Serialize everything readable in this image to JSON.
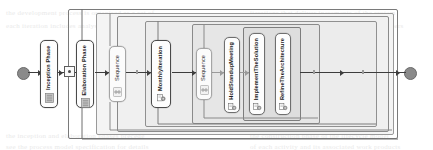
{
  "diagram": {
    "type": "uml-activity-diagram",
    "colors": {
      "node_border": "#6f6f6f",
      "node_fill": "#fdfdfd",
      "frame_fill": "#f0f0f0",
      "terminal_fill": "#8a8a8a",
      "edge": "#3d3d3d"
    }
  },
  "nodes": {
    "start": {
      "name": "initial-node",
      "label": ""
    },
    "inception_phase": {
      "label": "Inception Phase",
      "icon": "phase-icon"
    },
    "junction": {
      "label": "",
      "icon": "junction-dot"
    },
    "elaboration_phase": {
      "label": "Elaboration Phase",
      "icon": "phase-icon"
    },
    "sequence_outer": {
      "label": "Sequence",
      "icon": "sequence-icon"
    },
    "monthly_iteration": {
      "label": "MonthlyIteration",
      "icon": "iteration-icon"
    },
    "sequence_inner": {
      "label": "Sequence",
      "icon": "sequence-icon"
    },
    "hold_standup_meeting": {
      "label": "HoldStandupMeeting",
      "icon": "task-icon"
    },
    "implement_the_solution": {
      "label": "ImplementTheSolution",
      "icon": "task-icon"
    },
    "refine_the_architecture": {
      "label": "RefineTheArchitecture",
      "icon": "task-icon"
    },
    "end": {
      "name": "final-node",
      "label": ""
    }
  },
  "frames": [
    {
      "id": "frame-outer",
      "label": ""
    },
    {
      "id": "frame-elaboration",
      "label": ""
    },
    {
      "id": "frame-sequence-outer",
      "label": ""
    },
    {
      "id": "frame-monthly-iteration",
      "label": ""
    },
    {
      "id": "frame-sequence-inner",
      "label": ""
    },
    {
      "id": "frame-parallel-tasks",
      "label": ""
    }
  ],
  "background_text": [
    {
      "text": "the development process is organised as a set of",
      "x": 6,
      "y": 9
    },
    {
      "text": "iterations that deliver increments of the system",
      "x": 250,
      "y": 9
    },
    {
      "text": "each iteration includes analysis design and test",
      "x": 6,
      "y": 22
    },
    {
      "text": "activities performed by the project team members",
      "x": 250,
      "y": 22
    },
    {
      "text": "the inception and elaboration phases precede",
      "x": 6,
      "y": 132
    },
    {
      "text": "the construction phase of the lifecycle model",
      "x": 250,
      "y": 132
    },
    {
      "text": "see the process model specification for details",
      "x": 6,
      "y": 143
    },
    {
      "text": "of each activity and its associated work products",
      "x": 250,
      "y": 143
    }
  ]
}
